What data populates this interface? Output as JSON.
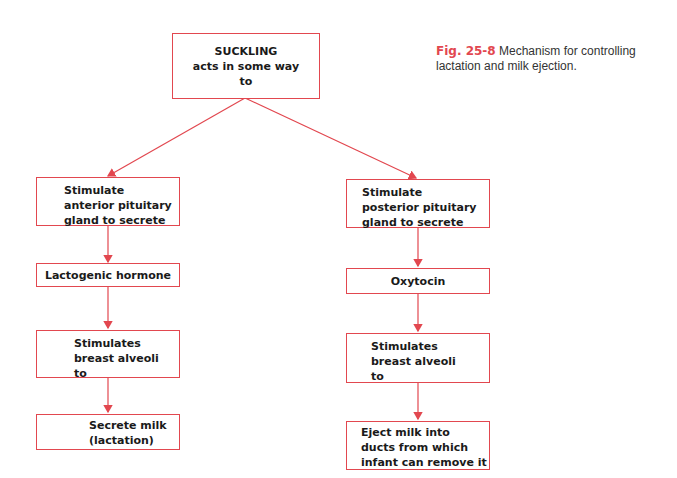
{
  "caption": {
    "figure_label": "Fig. 25-8",
    "text": "Mechanism for controlling lactation and milk ejection."
  },
  "diagram": {
    "root": {
      "text": "SUCKLING\nacts in some way\nto"
    },
    "left_branch": [
      {
        "text": "Stimulate\nanterior pituitary\ngland to secrete"
      },
      {
        "text": "Lactogenic hormone"
      },
      {
        "text": "Stimulates\nbreast alveoli\nto"
      },
      {
        "text": "Secrete milk\n(lactation)"
      }
    ],
    "right_branch": [
      {
        "text": "Stimulate\nposterior pituitary\ngland to secrete"
      },
      {
        "text": "Oxytocin"
      },
      {
        "text": "Stimulates\nbreast alveoli\nto"
      },
      {
        "text": "Eject milk into\nducts from which\ninfant can remove it"
      }
    ],
    "colors": {
      "line": "#e2474f",
      "text": "#1a1a1a"
    }
  }
}
